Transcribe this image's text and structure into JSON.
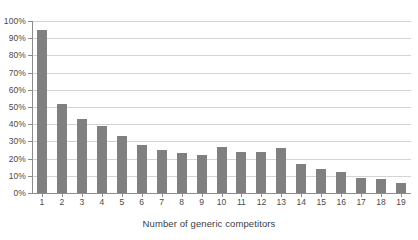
{
  "chart_data": {
    "type": "bar",
    "title": "",
    "subtitle": "",
    "xlabel": "Number of generic competitors",
    "ylabel": "",
    "categories": [
      "1",
      "2",
      "3",
      "4",
      "5",
      "6",
      "7",
      "8",
      "9",
      "10",
      "11",
      "12",
      "13",
      "14",
      "15",
      "16",
      "17",
      "18",
      "19"
    ],
    "values": [
      95,
      52,
      43,
      39,
      33,
      28,
      25,
      23,
      22,
      27,
      24,
      24,
      26,
      17,
      14,
      12,
      9,
      8,
      6
    ],
    "ylim": [
      0,
      100
    ],
    "ytick_labels": [
      "0%",
      "10%",
      "20%",
      "30%",
      "40%",
      "50%",
      "60%",
      "70%",
      "80%",
      "90%",
      "100%"
    ],
    "ytick_values": [
      0,
      10,
      20,
      30,
      40,
      50,
      60,
      70,
      80,
      90,
      100
    ],
    "grid": true,
    "legend": null,
    "legend_position": "none",
    "bar_color": "#808080",
    "gridline_color": "#d4d4d4",
    "axis_color": "#8c8c8c",
    "text_color": "#4a4a4a",
    "background": "#ffffff"
  }
}
